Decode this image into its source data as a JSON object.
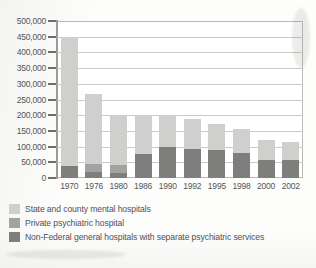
{
  "chart_data": {
    "type": "bar",
    "title": "",
    "subtitle": "",
    "xlabel": "",
    "ylabel": "",
    "stacked": true,
    "grid": true,
    "legend_position": "bottom-left",
    "ylim": [
      0,
      500000
    ],
    "ytick_interval": 50000,
    "ytick_labels": [
      "500,000",
      "450,000",
      "400,000",
      "350,000",
      "300,000",
      "250,000",
      "200,000",
      "150,000",
      "100,000",
      "50,000",
      "0"
    ],
    "ytick_values": [
      500000,
      450000,
      400000,
      350000,
      300000,
      250000,
      200000,
      150000,
      100000,
      50000,
      0
    ],
    "categories": [
      "1970",
      "1976",
      "1980",
      "1986",
      "1990",
      "1992",
      "1995",
      "1998",
      "2000",
      "2002"
    ],
    "series": [
      {
        "name": "State and county mental hospitals",
        "color": "#cfcfcd",
        "values": [
          413000,
          222000,
          160000,
          125000,
          100000,
          96000,
          83000,
          75000,
          62000,
          58000
        ]
      },
      {
        "name": "Private psychiatric hospital",
        "color": "#a2a2a0",
        "values": [
          0,
          26000,
          25000,
          0,
          0,
          0,
          0,
          0,
          0,
          0
        ]
      },
      {
        "name": "Non-Federal general hospitals with separate psychiatric services",
        "color": "#7e7e7d",
        "values": [
          37000,
          19000,
          15000,
          75000,
          100000,
          92000,
          89000,
          80000,
          58000,
          57000
        ]
      }
    ],
    "stack_totals": [
      450000,
      267000,
      200000,
      200000,
      200000,
      188000,
      172000,
      155000,
      120000,
      115000
    ]
  },
  "legend": {
    "items": [
      {
        "label": "State and county mental hospitals",
        "color": "#cfcfcd"
      },
      {
        "label": "Private psychiatric hospital",
        "color": "#a2a2a0"
      },
      {
        "label": "Non-Federal general hospitals with separate psychiatric services",
        "color": "#7e7e7d"
      }
    ]
  }
}
